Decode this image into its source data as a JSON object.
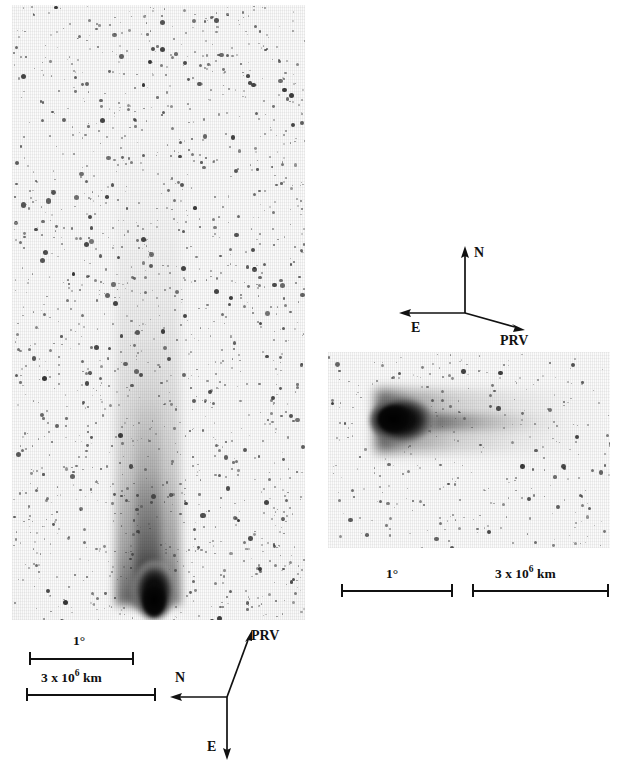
{
  "figure": {
    "background_color": "#ffffff",
    "ink_color": "#111111"
  },
  "panels": [
    {
      "id": "left-panel",
      "name": "wide-field-plate",
      "description": "Wide-field photographic plate showing dense star field and the comet with a long straight ion tail extending upward from the coma near the bottom.",
      "x": 12,
      "y": 5,
      "width": 293,
      "height": 615,
      "comet": {
        "coma_x": 150,
        "coma_y": 597,
        "tail_direction": "up",
        "tail_length_px": 470
      },
      "annotations": {
        "scalebars": [
          {
            "name": "angular-scale-bar",
            "label": "1",
            "label_suffix": "°",
            "x1": 29,
            "x2": 133,
            "y": 658
          },
          {
            "name": "linear-scale-bar",
            "label_prefix": "3 x 10",
            "label_exponent": "6",
            "label_unit": " km",
            "x1": 26,
            "x2": 155,
            "y": 694
          }
        ],
        "compass": {
          "name": "orientation-compass-left",
          "origin_x": 227,
          "origin_y": 697,
          "arrows": [
            {
              "label": "N",
              "tip_x": 172,
              "tip_y": 697
            },
            {
              "label": "E",
              "tip_x": 227,
              "tip_y": 757
            },
            {
              "label": "PRV",
              "tip_x": 250,
              "tip_y": 630
            }
          ]
        }
      }
    },
    {
      "id": "right-panel",
      "name": "close-up-plate",
      "description": "Close-up photographic plate showing the bright comet coma at left with the tail streaming to the right.",
      "x": 328,
      "y": 352,
      "width": 282,
      "height": 196,
      "comet": {
        "coma_x": 388,
        "coma_y": 418,
        "tail_direction": "right",
        "tail_length_px": 210
      },
      "annotations": {
        "scalebars": [
          {
            "name": "angular-scale-bar",
            "label": "1",
            "label_suffix": "°",
            "x1": 341,
            "x2": 452,
            "y": 590
          },
          {
            "name": "linear-scale-bar",
            "label_prefix": "3 x 10",
            "label_exponent": "6",
            "label_unit": " km",
            "x1": 472,
            "x2": 608,
            "y": 590
          }
        ],
        "compass": {
          "name": "orientation-compass-right",
          "origin_x": 465,
          "origin_y": 313,
          "arrows": [
            {
              "label": "N",
              "tip_x": 465,
              "tip_y": 249
            },
            {
              "label": "E",
              "tip_x": 400,
              "tip_y": 312
            },
            {
              "label": "PRV",
              "tip_x": 524,
              "tip_y": 331
            }
          ]
        }
      }
    }
  ],
  "labels": {
    "degree_1": "1°",
    "deg_value": "1",
    "deg_symbol": "°",
    "km_prefix": "3 x 10",
    "km_exponent": "6",
    "km_unit": "km",
    "north": "N",
    "east": "E",
    "prv": "PRV"
  }
}
